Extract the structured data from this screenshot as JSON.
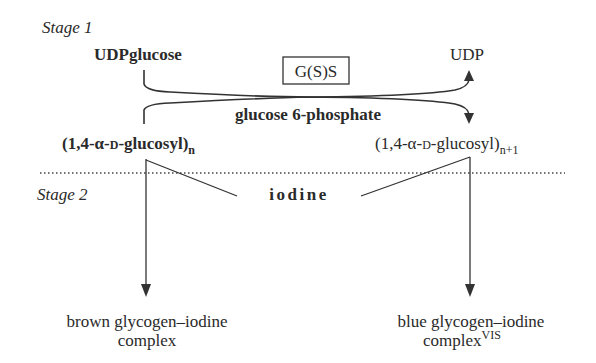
{
  "diagram": {
    "stage1_label": "Stage 1",
    "stage2_label": "Stage 2",
    "enzyme_box": "G(S)S",
    "substrate": "UDPglucose",
    "product": "UDP",
    "activator": "glucose 6-phosphate",
    "primer": {
      "main": "(1,4-α-",
      "sc": "D",
      "rest": "-glucosyl)",
      "subscript": "n"
    },
    "elongated": {
      "main": "(1,4-α-",
      "sc": "D",
      "rest": "-glucosyl)",
      "subscript": "n+1"
    },
    "reagent": "iodine",
    "left_result": {
      "line1": "brown glycogen–iodine",
      "line2": "complex"
    },
    "right_result": {
      "line1": "blue glycogen–iodine",
      "line2": "complex",
      "superscript": "VIS"
    },
    "colors": {
      "ink": "#2a2a2a",
      "background": "#ffffff"
    }
  }
}
